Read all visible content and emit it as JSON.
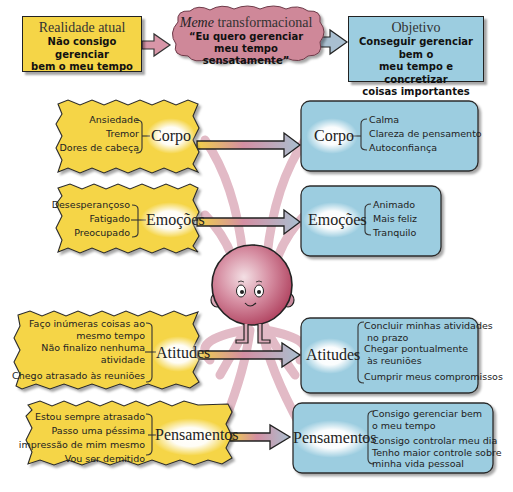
{
  "top": {
    "current_reality": {
      "title": "Realidade atual",
      "lines": [
        "Não consigo gerenciar",
        "bem o meu tempo"
      ]
    },
    "meme": {
      "title_italic": "Meme",
      "title_rest": " transformacional",
      "lines": [
        "“Eu quero gerenciar",
        "meu tempo sensatamente”"
      ]
    },
    "objective": {
      "title": "Objetivo",
      "lines": [
        "Conseguir gerenciar bem o",
        "meu tempo e concretizar",
        "coisas importantes"
      ]
    }
  },
  "left": [
    {
      "label": "Corpo",
      "items": [
        "Ansiedade",
        "Tremor",
        "Dores de cabeça"
      ]
    },
    {
      "label": "Emoções",
      "items": [
        "Desesperançoso",
        "Fatigado",
        "Preocupado"
      ]
    },
    {
      "label": "Atitudes",
      "items": [
        "Faço inúmeras coisas ao",
        "mesmo tempo",
        "Não finalizo nenhuma",
        "atividade",
        "Chego atrasado às reuniões"
      ]
    },
    {
      "label": "Pensamentos",
      "items": [
        "Estou sempre atrasado",
        "Passo uma péssima",
        "impressão de mim mesmo",
        "Vou ser demitido"
      ]
    }
  ],
  "right": [
    {
      "label": "Corpo",
      "items": [
        "Calma",
        "Clareza de pensamento",
        "Autoconfiança"
      ]
    },
    {
      "label": "Emoções",
      "items": [
        "Animado",
        "Mais feliz",
        "Tranquilo"
      ]
    },
    {
      "label": "Atitudes",
      "items": [
        "Concluir minhas atividades",
        "no prazo",
        "Chegar pontualmente",
        "às reuniões",
        "Cumprir meus compromissos"
      ]
    },
    {
      "label": "Pensamentos",
      "items": [
        "Consigo gerenciar bem",
        "o meu tempo",
        "Consigo controlar meu dia",
        "Tenho maior controle sobre",
        "minha vida pessoal"
      ]
    }
  ],
  "colors": {
    "yellow": "#f5d547",
    "blue": "#9ccde0",
    "pink": "#c98a9e",
    "character": "#c0506e"
  }
}
